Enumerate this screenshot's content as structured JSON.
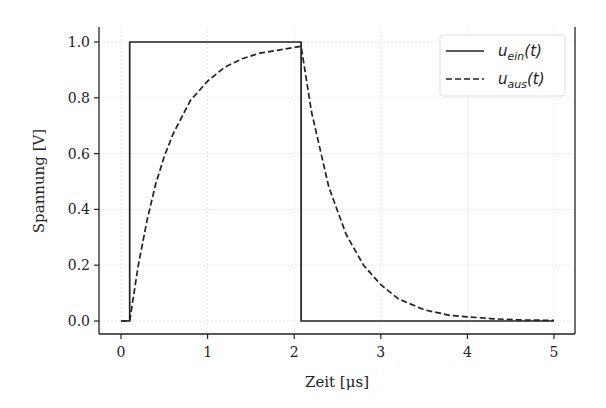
{
  "chart_data": {
    "type": "line",
    "title": "",
    "xlabel": "Zeit [μs]",
    "ylabel": "Spannung [V]",
    "xlim": [
      -0.25,
      5.25
    ],
    "ylim": [
      -0.05,
      1.05
    ],
    "xticks": [
      0,
      1,
      2,
      3,
      4,
      5
    ],
    "xtick_labels": [
      "0",
      "1",
      "2",
      "3",
      "4",
      "5"
    ],
    "yticks": [
      0.0,
      0.2,
      0.4,
      0.6,
      0.8,
      1.0
    ],
    "ytick_labels": [
      "0.0",
      "0.2",
      "0.4",
      "0.6",
      "0.8",
      "1.0"
    ],
    "grid": true,
    "legend_position": "upper right",
    "series": [
      {
        "name": "u_ein(t)",
        "legend_main": "u",
        "legend_sub": "ein",
        "legend_suffix": "(t)",
        "style": "solid",
        "color": "#222222",
        "x": [
          0,
          0.1,
          0.1,
          2.08,
          2.08,
          5
        ],
        "y": [
          0,
          0,
          1,
          1,
          0,
          0
        ]
      },
      {
        "name": "u_aus(t)",
        "legend_main": "u",
        "legend_sub": "aus",
        "legend_suffix": "(t)",
        "style": "dashed",
        "color": "#222222",
        "x": [
          0,
          0.1,
          0.2,
          0.3,
          0.4,
          0.5,
          0.6,
          0.8,
          1.0,
          1.2,
          1.4,
          1.6,
          1.8,
          2.08,
          2.2,
          2.4,
          2.6,
          2.8,
          3.0,
          3.2,
          3.5,
          3.8,
          4.0,
          4.3,
          4.6,
          5.0
        ],
        "y": [
          0,
          0,
          0.2,
          0.36,
          0.49,
          0.59,
          0.67,
          0.79,
          0.86,
          0.91,
          0.94,
          0.96,
          0.97,
          0.985,
          0.75,
          0.48,
          0.31,
          0.2,
          0.13,
          0.08,
          0.04,
          0.02,
          0.015,
          0.008,
          0.004,
          0.002
        ]
      }
    ]
  }
}
